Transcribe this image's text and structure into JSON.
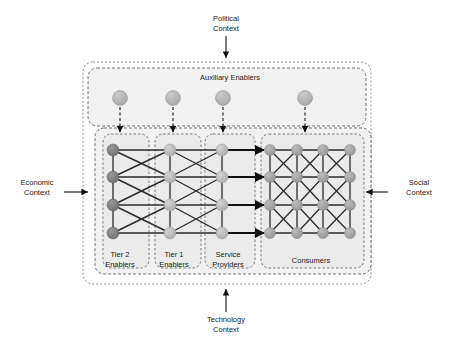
{
  "diagram": {
    "title_context_labels": {
      "political": "Political\nContext",
      "economic": "Economic\nContext",
      "social": "Social\nContext",
      "technology": "Technology\nContext"
    },
    "auxiliary": {
      "label": "Auxiliary Enablers",
      "node_count": 4,
      "node_x": [
        120,
        173,
        223,
        305
      ],
      "node_y": 98,
      "node_radius": 7.5,
      "node_color": "#b0b0b0",
      "box": {
        "x": 88,
        "y": 68,
        "w": 278,
        "h": 58
      }
    },
    "columns": [
      {
        "id": "tier2",
        "label": "Tier 2\nEnablers",
        "x": 113,
        "node_color": "#7d7d7d",
        "box": {
          "x": 103,
          "y": 134,
          "w": 46,
          "h": 134
        }
      },
      {
        "id": "tier1",
        "label": "Tier 1\nEnablers",
        "x": 170,
        "node_color": "#b5b5b5",
        "box": {
          "x": 155,
          "y": 134,
          "w": 46,
          "h": 134
        }
      },
      {
        "id": "service_providers",
        "label": "Service\nProviders",
        "x": 222,
        "node_color": "#b5b5b5",
        "box": {
          "x": 205,
          "y": 134,
          "w": 50,
          "h": 134
        }
      },
      {
        "id": "consumers",
        "label": "Consumers",
        "x": 270,
        "node_color": "#9e9e9e",
        "box": {
          "x": 261,
          "y": 134,
          "w": 103,
          "h": 134
        }
      }
    ],
    "consumer_columns_x": [
      270,
      297,
      323,
      350
    ],
    "row_y": [
      150,
      177,
      205,
      233
    ],
    "node_radius": 6,
    "network_box": {
      "x": 95,
      "y": 128,
      "w": 276,
      "h": 146
    },
    "outer_box": {
      "x": 83,
      "y": 62,
      "w": 288,
      "h": 222
    },
    "colors": {
      "link": "#2b2b2b",
      "dashed_border": "#7a7a7a",
      "zone_fill": "#f0f0f0",
      "arrow": "#111111",
      "text": "#1a1a1a"
    },
    "context_arrows": {
      "political": {
        "x1": 226,
        "y1": 36,
        "x2": 226,
        "y2": 58,
        "direction": "down"
      },
      "economic": {
        "x1": 64,
        "y1": 192,
        "x2": 88,
        "y2": 192,
        "direction": "right"
      },
      "social": {
        "x1": 388,
        "y1": 192,
        "x2": 366,
        "y2": 192,
        "direction": "left"
      },
      "technology": {
        "x1": 226,
        "y1": 312,
        "x2": 226,
        "y2": 289,
        "direction": "up"
      }
    }
  }
}
